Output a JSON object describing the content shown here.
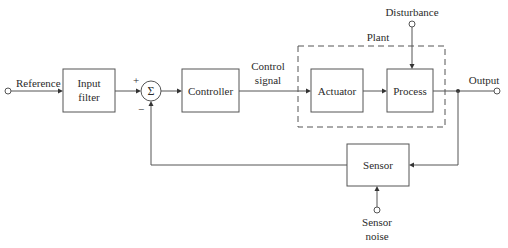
{
  "diagram": {
    "type": "feedback-control-block-diagram",
    "colors": {
      "line": "#555555",
      "text": "#2b2b2b",
      "background": "#ffffff"
    },
    "inputs": {
      "reference": "Reference",
      "disturbance": "Disturbance",
      "sensor_noise_line1": "Sensor",
      "sensor_noise_line2": "noise"
    },
    "output": "Output",
    "blocks": {
      "input_filter_line1": "Input",
      "input_filter_line2": "filter",
      "summing_junction": "Σ",
      "controller": "Controller",
      "actuator": "Actuator",
      "process": "Process",
      "sensor": "Sensor"
    },
    "plant_label": "Plant",
    "control_signal_line1": "Control",
    "control_signal_line2": "signal",
    "signs": {
      "plus": "+",
      "minus": "−"
    }
  }
}
